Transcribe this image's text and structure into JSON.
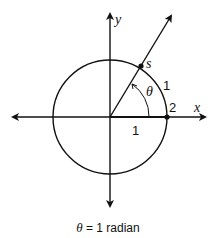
{
  "diagram": {
    "axes": {
      "x_label": "x",
      "y_label": "y"
    },
    "circle": {
      "radius_label": "1"
    },
    "angle_label": "θ",
    "points": {
      "s_label": "s",
      "point_2_label": "2"
    },
    "arc_label": "1",
    "caption": {
      "theta": "θ",
      "text": " = 1 radian"
    }
  }
}
